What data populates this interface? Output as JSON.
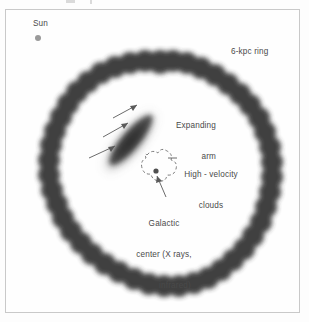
{
  "figure": {
    "background_color": "#fdfdfd",
    "frame_color": "#c9c9c9",
    "ink_color": "#2b2b2b",
    "text_color": "#4a4a4a"
  },
  "labels": {
    "sun": "Sun",
    "ring": "6-kpc ring",
    "expanding_arm_line1": "Expanding",
    "expanding_arm_line2": "arm",
    "high_velocity_line1": "High - velocity",
    "high_velocity_line2": "clouds",
    "galactic_center_line1": "Galactic",
    "galactic_center_line2": "center (X rays,",
    "galactic_center_line3": "infrared)"
  },
  "features": {
    "sun_marker": {
      "x": 38,
      "y": 38,
      "radius": 3.0,
      "color": "#9a9a9a"
    },
    "galactic_center_marker": {
      "x": 156,
      "y": 171,
      "radius": 2.6,
      "color": "#555555"
    },
    "ring": {
      "description": "lumpy closed loop of overlapping dark blobs",
      "center_x": 160,
      "center_y": 178,
      "radius_x": 112,
      "radius_y": 118,
      "blob_count": 46,
      "blob_radius": 11
    },
    "expanding_arm": {
      "description": "elongated dark streak tilted up-right",
      "center_x": 130,
      "center_y": 142,
      "length": 78,
      "thickness": 25,
      "rotation_deg": -50
    },
    "high_velocity_clouds_outline": {
      "description": "dashed scalloped cloud around galactic center",
      "center_x": 156,
      "center_y": 168,
      "radius": 17,
      "lobes": 6
    },
    "arrows": [
      {
        "name": "arm-arrow-upper",
        "x1": 113,
        "y1": 118,
        "x2": 137,
        "y2": 105
      },
      {
        "name": "arm-arrow-middle",
        "x1": 103,
        "y1": 137,
        "x2": 128,
        "y2": 123
      },
      {
        "name": "arm-arrow-lower",
        "x1": 89,
        "y1": 158,
        "x2": 115,
        "y2": 146
      },
      {
        "name": "galactic-center-arrow",
        "x1": 165,
        "y1": 196,
        "x2": 157,
        "y2": 176
      }
    ],
    "leader_lines": [
      {
        "name": "high-velocity-clouds-leader",
        "x1": 168,
        "y1": 158,
        "x2": 177,
        "y2": 158
      }
    ]
  }
}
